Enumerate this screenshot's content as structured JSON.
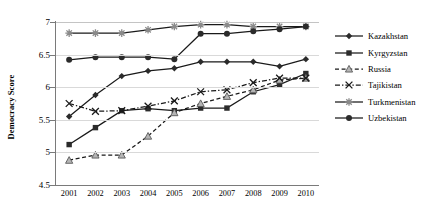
{
  "chart_data": {
    "type": "line",
    "title": "",
    "xlabel": "",
    "ylabel": "Democracy Score",
    "categories": [
      "2001",
      "2002",
      "2003",
      "2004",
      "2005",
      "2006",
      "2007",
      "2008",
      "2009",
      "2010"
    ],
    "x": [
      2001,
      2002,
      2003,
      2004,
      2005,
      2006,
      2007,
      2008,
      2009,
      2010
    ],
    "ylim": [
      4.5,
      7
    ],
    "ytick_labels": [
      "4.5",
      "5",
      "5.5",
      "6",
      "6.5",
      "7"
    ],
    "yticks": [
      4.5,
      5,
      5.5,
      6,
      6.5,
      7
    ],
    "grid": "horizontal",
    "legend_position": "right",
    "series": [
      {
        "name": "Kazakhstan",
        "marker": "diamond",
        "line_style": "solid",
        "values": [
          5.55,
          5.88,
          6.17,
          6.25,
          6.29,
          6.39,
          6.39,
          6.39,
          6.32,
          6.43
        ]
      },
      {
        "name": "Kyrgyzstan",
        "marker": "square",
        "line_style": "solid",
        "values": [
          5.12,
          5.38,
          5.64,
          5.67,
          5.64,
          5.68,
          5.68,
          5.93,
          6.04,
          6.21
        ]
      },
      {
        "name": "Russia",
        "marker": "triangle",
        "line_style": "dashed",
        "values": [
          4.88,
          4.96,
          4.96,
          5.25,
          5.61,
          5.75,
          5.86,
          5.96,
          6.11,
          6.14
        ]
      },
      {
        "name": "Tajikistan",
        "marker": "x",
        "line_style": "dash-dot",
        "values": [
          5.75,
          5.63,
          5.64,
          5.71,
          5.79,
          5.93,
          5.96,
          6.07,
          6.14,
          6.14
        ]
      },
      {
        "name": "Turkmenistan",
        "marker": "star",
        "line_style": "solid",
        "values": [
          6.83,
          6.83,
          6.83,
          6.88,
          6.93,
          6.96,
          6.96,
          6.93,
          6.93,
          6.93
        ]
      },
      {
        "name": "Uzbekistan",
        "marker": "circle",
        "line_style": "solid",
        "values": [
          6.42,
          6.46,
          6.46,
          6.46,
          6.43,
          6.82,
          6.82,
          6.86,
          6.89,
          6.93
        ]
      }
    ]
  },
  "legend": {
    "items": [
      {
        "label": "Kazakhstan"
      },
      {
        "label": "Kyrgyzstan"
      },
      {
        "label": "Russia"
      },
      {
        "label": "Tajikistan"
      },
      {
        "label": "Turkmenistan"
      },
      {
        "label": "Uzbekistan"
      }
    ]
  },
  "colors": {
    "line": "#1a1a1a",
    "grid": "#d9d9d9",
    "axis": "#7a7a7a",
    "marker_fill_solid": "#2b2b2b",
    "marker_fill_light": "#b5b5b5"
  }
}
